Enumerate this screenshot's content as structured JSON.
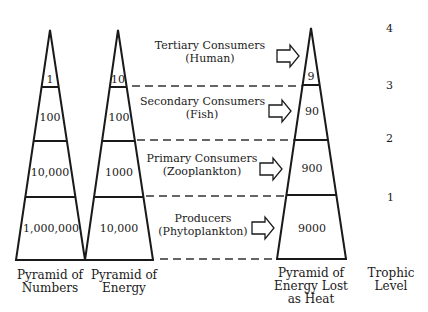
{
  "pyramids": {
    "numbers": {
      "title_line1": "Pyramid of",
      "title_line2": "Numbers",
      "values": [
        "1",
        "100",
        "10,000",
        "1,000,000"
      ]
    },
    "energy": {
      "title_line1": "Pyramid of",
      "title_line2": "Energy",
      "values": [
        "10",
        "100",
        "1000",
        "10,000"
      ]
    },
    "heat": {
      "title_line1": "Pyramid of",
      "title_line2": "Energy Lost",
      "title_line3": "as Heat",
      "values": [
        "9",
        "90",
        "900",
        "9000"
      ]
    }
  },
  "consumers": [
    {
      "line1": "Tertiary Consumers",
      "line2": "(Human)"
    },
    {
      "line1": "Secondary Consumers",
      "line2": "(Fish)"
    },
    {
      "line1": "Primary Consumers",
      "line2": "(Zooplankton)"
    },
    {
      "line1": "Producers",
      "line2": "(Phytoplankton)"
    }
  ],
  "trophic": {
    "title_line1": "Trophic",
    "title_line2": "Level",
    "levels": [
      "4",
      "3",
      "2",
      "1"
    ]
  },
  "colors": {
    "line": "#1a1a1a",
    "dash": "#333333",
    "background": "#ffffff"
  }
}
